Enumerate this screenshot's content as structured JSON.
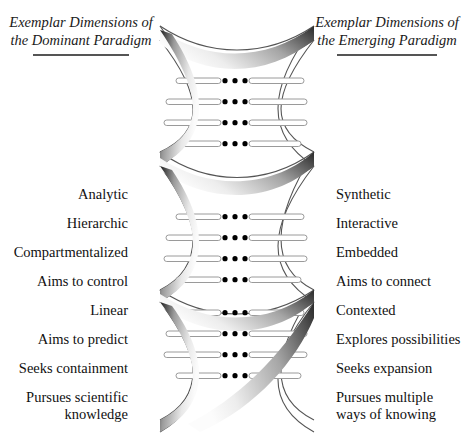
{
  "figure": {
    "type": "diagram",
    "background_color": "#ffffff",
    "text_color": "#111111",
    "rule_color": "#555555"
  },
  "header_left": {
    "line1": "Exemplar",
    "line2": "Dimensions of",
    "line3": "the Dominant",
    "line4": "Paradigm"
  },
  "header_right": {
    "line1": "Exemplar",
    "line2": "Dimensions of",
    "line3": "the Emerging",
    "line4": "Paradigm"
  },
  "left_column": {
    "rows": [
      {
        "line1": "Analytic"
      },
      {
        "line1": "Hierarchic"
      },
      {
        "line1": "Compartmentalized"
      },
      {
        "line1": "Aims to control"
      },
      {
        "line1": "Linear"
      },
      {
        "line1": "Aims to predict"
      },
      {
        "line1": "Seeks containment"
      },
      {
        "line1": "Pursues scientific",
        "line2": "knowledge"
      }
    ]
  },
  "right_column": {
    "rows": [
      {
        "line1": "Synthetic"
      },
      {
        "line1": "Interactive"
      },
      {
        "line1": "Embedded"
      },
      {
        "line1": "Aims to connect"
      },
      {
        "line1": "Contexted"
      },
      {
        "line1": "Explores possibilities"
      },
      {
        "line1": "Seeks expansion"
      },
      {
        "line1": "Pursues multiple",
        "line2": "ways of knowing"
      }
    ]
  },
  "helix": {
    "strand_count": 2,
    "bulges": 3,
    "rung_rows_per_bulge": 4,
    "dots_per_row": 3,
    "dot_color": "#000000",
    "ribbon_dark": "#1c1c1c",
    "ribbon_light": "#f2f2f2",
    "rung_fill": "#ffffff",
    "rung_stroke": "#9a9a9a",
    "outline_color": "#555555"
  }
}
